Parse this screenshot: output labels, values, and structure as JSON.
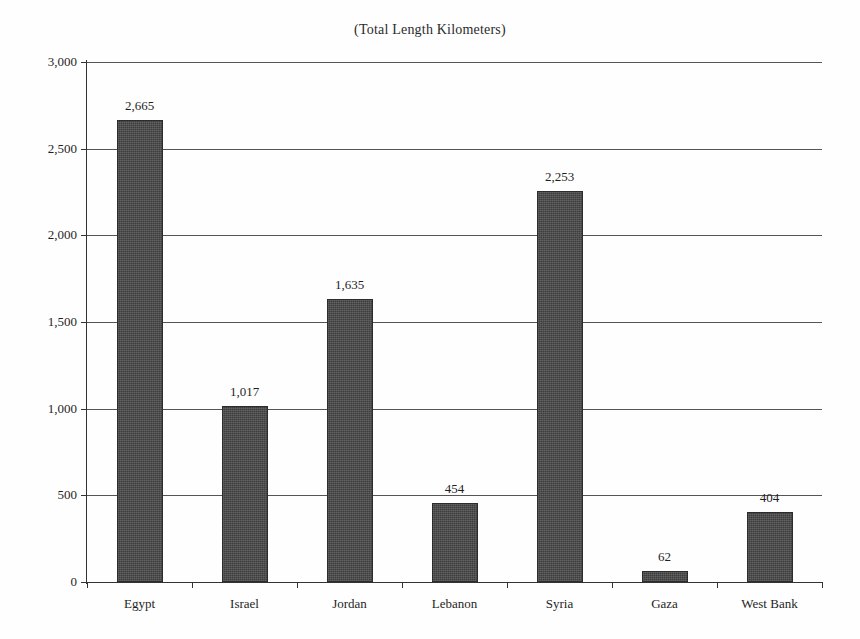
{
  "chart_data": {
    "type": "bar",
    "title": "(Total Length Kilometers)",
    "xlabel": "",
    "ylabel": "",
    "categories": [
      "Egypt",
      "Israel",
      "Jordan",
      "Lebanon",
      "Syria",
      "Gaza",
      "West Bank"
    ],
    "values": [
      2665,
      1017,
      1635,
      454,
      2253,
      62,
      404
    ],
    "value_labels": [
      "2,665",
      "1,017",
      "1,635",
      "454",
      "2,253",
      "62",
      "404"
    ],
    "ylim": [
      0,
      3000
    ],
    "ytick_values": [
      0,
      500,
      1000,
      1500,
      2000,
      2500,
      3000
    ],
    "ytick_labels": [
      "0",
      "500",
      "1,000",
      "1,500",
      "2,000",
      "2,500",
      "3,000"
    ],
    "grid": true,
    "legend": null,
    "series_color": "#3d3d3d",
    "axis_color": "#333333",
    "gridline_color": "#555555",
    "background": "#fefefe"
  }
}
